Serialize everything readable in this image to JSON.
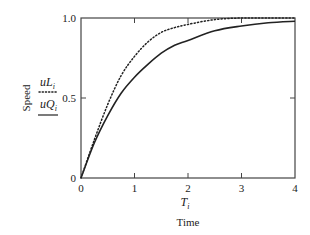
{
  "chart_data": {
    "type": "line",
    "title": "",
    "xlabel": "Time",
    "xlabel_symbol": "T_i",
    "ylabel": "Speed",
    "xlim": [
      0,
      4
    ],
    "ylim": [
      0,
      1.0
    ],
    "x_ticks": [
      "0",
      "1",
      "2",
      "3",
      "4"
    ],
    "y_ticks": [
      "0",
      "0.5",
      "1.0"
    ],
    "grid": false,
    "legend_position": "left of y-axis, stacked vertically beside ylabel",
    "series": [
      {
        "name": "uL_i",
        "label_base": "uL",
        "label_sub": "i",
        "style": "dotted",
        "color": "#222222",
        "x": [
          0,
          0.25,
          0.5,
          0.75,
          1.0,
          1.25,
          1.5,
          1.75,
          2.0,
          2.5,
          3.0,
          3.5,
          4.0
        ],
        "values": [
          0,
          0.24,
          0.46,
          0.64,
          0.76,
          0.85,
          0.91,
          0.94,
          0.96,
          0.99,
          1.0,
          1.0,
          1.0
        ]
      },
      {
        "name": "uQ_i",
        "label_base": "uQ",
        "label_sub": "i",
        "style": "solid",
        "color": "#222222",
        "x": [
          0,
          0.25,
          0.5,
          0.75,
          1.0,
          1.25,
          1.5,
          1.75,
          2.0,
          2.5,
          3.0,
          3.5,
          4.0
        ],
        "values": [
          0,
          0.22,
          0.39,
          0.53,
          0.63,
          0.71,
          0.78,
          0.83,
          0.86,
          0.92,
          0.95,
          0.97,
          0.98
        ]
      }
    ]
  },
  "axes": {
    "x_symbol_base": "T",
    "x_symbol_sub": "i",
    "x_name": "Time",
    "y_name": "Speed"
  },
  "legend": {
    "items": [
      {
        "base": "uL",
        "sub": "i",
        "style": "dotted"
      },
      {
        "base": "uQ",
        "sub": "i",
        "style": "solid"
      }
    ]
  }
}
